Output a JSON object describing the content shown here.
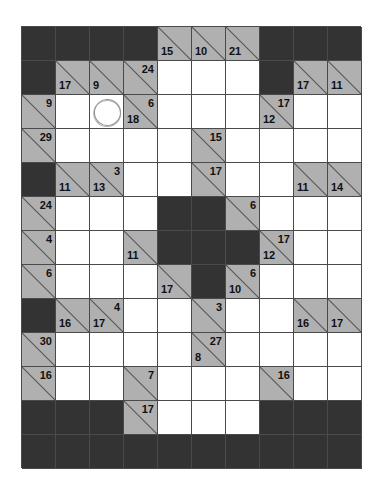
{
  "puzzle": {
    "type": "kakuro",
    "columns": 10,
    "rows": 13,
    "colors": {
      "block": "#333333",
      "clue": "#b0b0b0",
      "entry": "#ffffff",
      "border": "#4a4a4a",
      "clue_text": "#111111",
      "pen_annotation": "#8e8e8e"
    },
    "annotations": [
      {
        "name": "pen-circle",
        "row": 2,
        "col": 2,
        "shape": "circle"
      }
    ],
    "cells": [
      [
        {
          "t": "block"
        },
        {
          "t": "block"
        },
        {
          "t": "block"
        },
        {
          "t": "block"
        },
        {
          "t": "clue",
          "down": "15"
        },
        {
          "t": "clue",
          "down": "10"
        },
        {
          "t": "clue",
          "down": "21"
        },
        {
          "t": "block"
        },
        {
          "t": "block"
        },
        {
          "t": "block"
        }
      ],
      [
        {
          "t": "block"
        },
        {
          "t": "clue",
          "down": "17"
        },
        {
          "t": "clue",
          "down": "9"
        },
        {
          "t": "clue",
          "across": "24"
        },
        {
          "t": "entry"
        },
        {
          "t": "entry"
        },
        {
          "t": "entry"
        },
        {
          "t": "block"
        },
        {
          "t": "clue",
          "down": "17"
        },
        {
          "t": "clue",
          "down": "11"
        }
      ],
      [
        {
          "t": "clue",
          "across": "9"
        },
        {
          "t": "entry"
        },
        {
          "t": "entry",
          "circle": true
        },
        {
          "t": "clue",
          "across": "6",
          "down": "18"
        },
        {
          "t": "entry"
        },
        {
          "t": "entry"
        },
        {
          "t": "entry"
        },
        {
          "t": "clue",
          "across": "17",
          "down": "12"
        },
        {
          "t": "entry"
        },
        {
          "t": "entry"
        }
      ],
      [
        {
          "t": "clue",
          "across": "29"
        },
        {
          "t": "entry"
        },
        {
          "t": "entry"
        },
        {
          "t": "entry"
        },
        {
          "t": "entry"
        },
        {
          "t": "clue",
          "across": "15"
        },
        {
          "t": "entry"
        },
        {
          "t": "entry"
        },
        {
          "t": "entry"
        },
        {
          "t": "entry"
        }
      ],
      [
        {
          "t": "block"
        },
        {
          "t": "clue",
          "down": "11"
        },
        {
          "t": "clue",
          "across": "3",
          "down": "13"
        },
        {
          "t": "entry"
        },
        {
          "t": "entry"
        },
        {
          "t": "clue",
          "across": "17"
        },
        {
          "t": "entry"
        },
        {
          "t": "entry"
        },
        {
          "t": "clue",
          "down": "11"
        },
        {
          "t": "clue",
          "down": "14"
        }
      ],
      [
        {
          "t": "clue",
          "across": "24"
        },
        {
          "t": "entry"
        },
        {
          "t": "entry"
        },
        {
          "t": "entry"
        },
        {
          "t": "block"
        },
        {
          "t": "block"
        },
        {
          "t": "clue",
          "across": "6"
        },
        {
          "t": "entry"
        },
        {
          "t": "entry"
        },
        {
          "t": "entry"
        }
      ],
      [
        {
          "t": "clue",
          "across": "4"
        },
        {
          "t": "entry"
        },
        {
          "t": "entry"
        },
        {
          "t": "clue",
          "down": "11"
        },
        {
          "t": "block"
        },
        {
          "t": "block"
        },
        {
          "t": "block"
        },
        {
          "t": "clue",
          "across": "17",
          "down": "12"
        },
        {
          "t": "entry"
        },
        {
          "t": "entry"
        }
      ],
      [
        {
          "t": "clue",
          "across": "6"
        },
        {
          "t": "entry"
        },
        {
          "t": "entry"
        },
        {
          "t": "entry"
        },
        {
          "t": "clue",
          "down": "17"
        },
        {
          "t": "block"
        },
        {
          "t": "clue",
          "across": "6",
          "down": "10"
        },
        {
          "t": "entry"
        },
        {
          "t": "entry"
        },
        {
          "t": "entry"
        }
      ],
      [
        {
          "t": "block"
        },
        {
          "t": "clue",
          "down": "16"
        },
        {
          "t": "clue",
          "across": "4",
          "down": "17"
        },
        {
          "t": "entry"
        },
        {
          "t": "entry"
        },
        {
          "t": "clue",
          "across": "3"
        },
        {
          "t": "entry"
        },
        {
          "t": "entry"
        },
        {
          "t": "clue",
          "down": "16"
        },
        {
          "t": "clue",
          "down": "17"
        }
      ],
      [
        {
          "t": "clue",
          "across": "30"
        },
        {
          "t": "entry"
        },
        {
          "t": "entry"
        },
        {
          "t": "entry"
        },
        {
          "t": "entry"
        },
        {
          "t": "clue",
          "across": "27",
          "down": "8"
        },
        {
          "t": "entry"
        },
        {
          "t": "entry"
        },
        {
          "t": "entry"
        },
        {
          "t": "entry"
        }
      ],
      [
        {
          "t": "clue",
          "across": "16"
        },
        {
          "t": "entry"
        },
        {
          "t": "entry"
        },
        {
          "t": "clue",
          "across": "7"
        },
        {
          "t": "entry"
        },
        {
          "t": "entry"
        },
        {
          "t": "entry"
        },
        {
          "t": "clue",
          "across": "16"
        },
        {
          "t": "entry"
        },
        {
          "t": "entry"
        }
      ],
      [
        {
          "t": "block"
        },
        {
          "t": "block"
        },
        {
          "t": "block"
        },
        {
          "t": "clue",
          "across": "17"
        },
        {
          "t": "entry"
        },
        {
          "t": "entry"
        },
        {
          "t": "entry"
        },
        {
          "t": "block"
        },
        {
          "t": "block"
        },
        {
          "t": "block"
        }
      ]
    ]
  }
}
